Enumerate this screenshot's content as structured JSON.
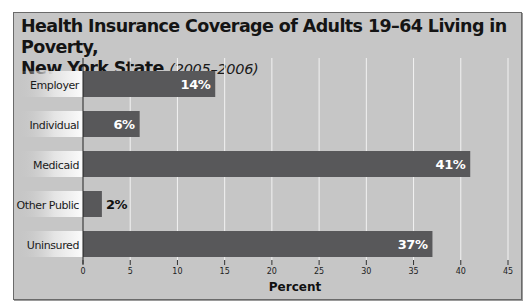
{
  "chart_data": {
    "type": "bar",
    "orientation": "horizontal",
    "title": "Health Insurance Coverage of Adults 19–64 Living in Poverty,",
    "title_line2": "New York State",
    "subtitle": "(2005–2006)",
    "xlabel": "Percent",
    "ylabel": "",
    "categories": [
      "Employer",
      "Individual",
      "Medicaid",
      "Other Public",
      "Uninsured"
    ],
    "values": [
      14,
      6,
      41,
      2,
      37
    ],
    "data_labels": [
      "14%",
      "6%",
      "41%",
      "2%",
      "37%"
    ],
    "xlim": [
      0,
      45
    ],
    "xticks": [
      0,
      5,
      10,
      15,
      20,
      25,
      30,
      35,
      40,
      45
    ],
    "xtick_labels": [
      "0",
      "5",
      "10",
      "15",
      "20",
      "25",
      "30",
      "35",
      "40",
      "45"
    ],
    "grid": true,
    "legend": "none"
  },
  "colors": {
    "bar": "#58585a",
    "background": "#c6c6c6",
    "grid": "#f2f2f2",
    "label_text_inside": "#ffffff",
    "label_text_outside": "#111111"
  }
}
